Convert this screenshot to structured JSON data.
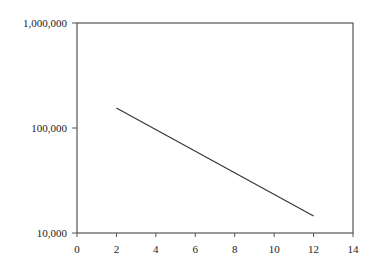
{
  "chart_data": {
    "type": "line",
    "title": "",
    "xlabel": "",
    "ylabel": "",
    "xscale": "linear",
    "yscale": "log",
    "xlim": [
      0,
      14
    ],
    "ylim": [
      10000,
      1000000
    ],
    "grid": false,
    "legend": null,
    "x_ticks": [
      0,
      2,
      4,
      6,
      8,
      10,
      12,
      14
    ],
    "x_tick_labels": [
      "0",
      "2",
      "4",
      "6",
      "8",
      "10",
      "12",
      "14"
    ],
    "y_ticks": [
      10000,
      100000,
      1000000
    ],
    "y_tick_labels": [
      "10,000",
      "100,000",
      "1,000,000"
    ],
    "series": [
      {
        "name": "series-1",
        "color": "#333333",
        "x": [
          2,
          12
        ],
        "y": [
          155000,
          14500
        ]
      }
    ]
  },
  "colors": {
    "axis": "#555555",
    "line": "#333333",
    "text": "#222222"
  }
}
